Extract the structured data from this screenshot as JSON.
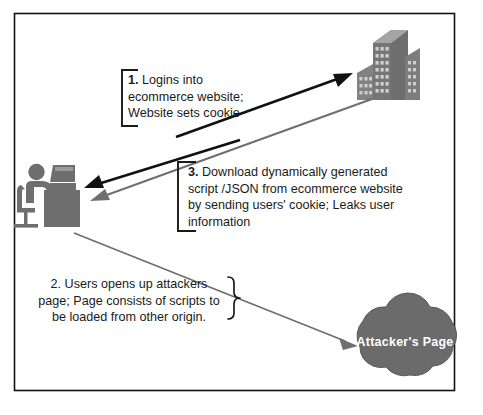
{
  "diagram": {
    "border_color": "#111111",
    "background": "#ffffff",
    "accent_gray": "#6e6e6e",
    "accent_black": "#111111",
    "steps": [
      {
        "id": "step-1",
        "number": "1.",
        "lines": [
          "Logins into",
          "ecommerce website;",
          "Website sets cookie"
        ],
        "bracket": "left-square",
        "number_bold": true
      },
      {
        "id": "step-3",
        "number": "3.",
        "lines": [
          "Download dynamically generated",
          "script /JSON from ecommerce website",
          "by sending users' cookie; Leaks user",
          "information"
        ],
        "bracket": "left-square",
        "number_bold": true
      },
      {
        "id": "step-2",
        "number": "2.",
        "lines": [
          "Users opens up attackers",
          "page; Page consists of scripts to",
          "be loaded from other origin."
        ],
        "bracket": "right-curly",
        "number_bold": false
      }
    ],
    "nodes": {
      "user": {
        "icon": "person-at-desk-icon",
        "label": ""
      },
      "server": {
        "icon": "office-building-icon",
        "label": ""
      },
      "attacker": {
        "icon": "cloud-icon",
        "label": "Attacker's Page"
      }
    },
    "arrows": [
      {
        "name": "arrow-user-to-server",
        "color": "#111111",
        "label": "1"
      },
      {
        "name": "arrow-server-to-user",
        "color": "#111111",
        "label": "1-response"
      },
      {
        "name": "arrow-server-script-to-user",
        "color": "#6e6e6e",
        "label": "3"
      },
      {
        "name": "arrow-user-to-attacker",
        "color": "#6e6e6e",
        "label": "2"
      }
    ]
  }
}
